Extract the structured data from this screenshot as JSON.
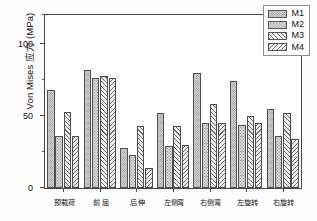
{
  "chart_data": {
    "type": "bar",
    "title": "",
    "xlabel": "",
    "ylabel": "Von Mises 应力 (MPa)",
    "ylim": [
      0,
      120
    ],
    "yticks": [
      0,
      50,
      100
    ],
    "ytick_labels": [
      "0",
      "50",
      "100"
    ],
    "yminor_ticks": [
      25,
      75,
      120
    ],
    "grid": false,
    "legend_position": "top-right",
    "categories": [
      "预载荷",
      "前 屈",
      "后 伸",
      "左侧弯",
      "右侧弯",
      "左旋转",
      "右旋转"
    ],
    "series": [
      {
        "name": "M1",
        "values": [
          68,
          82,
          28,
          52,
          80,
          74,
          55
        ]
      },
      {
        "name": "M2",
        "values": [
          36,
          76,
          23,
          29,
          45,
          44,
          36
        ]
      },
      {
        "name": "M3",
        "values": [
          53,
          78,
          43,
          43,
          58,
          50,
          52
        ]
      },
      {
        "name": "M4",
        "values": [
          36,
          76,
          14,
          30,
          45,
          45,
          34
        ]
      }
    ]
  },
  "legend": {
    "items": [
      {
        "label": "M1",
        "pattern": "dense-stipple"
      },
      {
        "label": "M2",
        "pattern": "sparse-stipple"
      },
      {
        "label": "M3",
        "pattern": "forward-hatch"
      },
      {
        "label": "M4",
        "pattern": "backward-hatch"
      }
    ]
  }
}
